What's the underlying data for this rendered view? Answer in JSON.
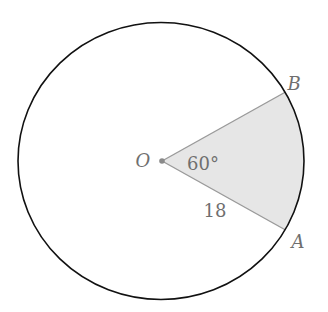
{
  "diagram": {
    "type": "circle-sector",
    "center_label": "O",
    "points": [
      {
        "name": "A",
        "label": "A"
      },
      {
        "name": "B",
        "label": "B"
      }
    ],
    "angle_label": "60°",
    "radius_label": "18",
    "colors": {
      "circle_stroke": "#111111",
      "radius_stroke": "#9a9a9a",
      "sector_fill": "#e6e6e6",
      "label_color": "#6f6f6f",
      "center_dot": "#8a8a8a"
    }
  }
}
